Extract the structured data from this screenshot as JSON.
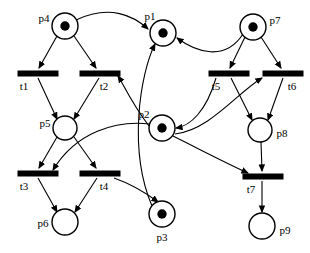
{
  "diagram": {
    "type": "petri-net",
    "width": 310,
    "height": 253,
    "background_color": "#ffffff",
    "stroke_color": "#000000"
  },
  "places": [
    {
      "id": "p4",
      "label": "p4",
      "cx": 65,
      "cy": 26,
      "r": 13,
      "tokens": 1,
      "label_x": 44,
      "label_y": 19,
      "label_anchor": "middle"
    },
    {
      "id": "p1",
      "label": "p1",
      "cx": 163,
      "cy": 33,
      "r": 13,
      "tokens": 1,
      "label_x": 150,
      "label_y": 17,
      "label_anchor": "middle"
    },
    {
      "id": "p7",
      "label": "p7",
      "cx": 253,
      "cy": 27,
      "r": 13,
      "tokens": 1,
      "label_x": 275,
      "label_y": 21,
      "label_anchor": "middle"
    },
    {
      "id": "p5",
      "label": "p5",
      "cx": 65,
      "cy": 128,
      "r": 12,
      "tokens": 0,
      "label_x": 45,
      "label_y": 124,
      "label_anchor": "middle"
    },
    {
      "id": "p2",
      "label": "p2",
      "cx": 162,
      "cy": 128,
      "r": 13,
      "tokens": 1,
      "label_x": 144,
      "label_y": 115,
      "label_anchor": "middle"
    },
    {
      "id": "p8",
      "label": "p8",
      "cx": 260,
      "cy": 130,
      "r": 12,
      "tokens": 0,
      "label_x": 282,
      "label_y": 134,
      "label_anchor": "middle"
    },
    {
      "id": "p6",
      "label": "p6",
      "cx": 65,
      "cy": 222,
      "r": 13,
      "tokens": 0,
      "label_x": 43,
      "label_y": 224,
      "label_anchor": "middle"
    },
    {
      "id": "p3",
      "label": "p3",
      "cx": 162,
      "cy": 214,
      "r": 13,
      "tokens": 1,
      "label_x": 162,
      "label_y": 238,
      "label_anchor": "middle"
    },
    {
      "id": "p9",
      "label": "p9",
      "cx": 262,
      "cy": 226,
      "r": 13,
      "tokens": 0,
      "label_x": 285,
      "label_y": 231,
      "label_anchor": "middle"
    }
  ],
  "transitions": [
    {
      "id": "t1",
      "label": "t1",
      "x": 18,
      "y": 71,
      "w": 40,
      "h": 5,
      "label_x": 24,
      "label_y": 87
    },
    {
      "id": "t2",
      "label": "t2",
      "x": 80,
      "y": 71,
      "w": 40,
      "h": 5,
      "label_x": 104,
      "label_y": 87
    },
    {
      "id": "t5",
      "label": "t5",
      "x": 209,
      "y": 71,
      "w": 40,
      "h": 5,
      "label_x": 216,
      "label_y": 87
    },
    {
      "id": "t6",
      "label": "t6",
      "x": 263,
      "y": 71,
      "w": 40,
      "h": 5,
      "label_x": 292,
      "label_y": 87
    },
    {
      "id": "t3",
      "label": "t3",
      "x": 18,
      "y": 171,
      "w": 40,
      "h": 5,
      "label_x": 24,
      "label_y": 187
    },
    {
      "id": "t4",
      "label": "t4",
      "x": 80,
      "y": 171,
      "w": 40,
      "h": 5,
      "label_x": 104,
      "label_y": 187
    },
    {
      "id": "t7",
      "label": "t7",
      "x": 243,
      "y": 174,
      "w": 40,
      "h": 5,
      "label_x": 251,
      "label_y": 190
    }
  ],
  "arcs": [
    {
      "from": "p4",
      "to": "t1",
      "d": "M 57 36 L 39 68"
    },
    {
      "from": "p4",
      "to": "t2",
      "d": "M 74 36 L 96 68"
    },
    {
      "from": "t1",
      "to": "p5",
      "d": "M 38 78 L 57 119"
    },
    {
      "from": "t2",
      "to": "p5",
      "d": "M 99 78 L 74 119"
    },
    {
      "from": "p4",
      "to": "p1",
      "d": "M 76 20 C 110 4 134 16 148 29"
    },
    {
      "from": "p5",
      "to": "t3",
      "d": "M 57 137 L 39 168"
    },
    {
      "from": "p5",
      "to": "t4",
      "d": "M 74 137 L 96 168"
    },
    {
      "from": "t3",
      "to": "p6",
      "d": "M 38 178 L 57 212"
    },
    {
      "from": "t4",
      "to": "p6",
      "d": "M 97 178 L 75 212"
    },
    {
      "from": "p2",
      "to": "t2",
      "d": "M 149 126 C 132 104 122 82 118 76"
    },
    {
      "from": "p2",
      "to": "t3",
      "d": "M 150 124 C 116 120 76 132 53 170"
    },
    {
      "from": "t4",
      "to": "p3",
      "d": "M 114 178 C 137 186 150 196 158 202"
    },
    {
      "from": "p3",
      "to": "p1",
      "d": "M 152 206 C 128 150 140 74 155 44"
    },
    {
      "from": "p7",
      "to": "t5",
      "d": "M 245 37 L 230 68"
    },
    {
      "from": "p7",
      "to": "t6",
      "d": "M 261 37 L 281 68"
    },
    {
      "from": "t5",
      "to": "p8",
      "d": "M 231 78 L 252 120"
    },
    {
      "from": "t6",
      "to": "p8",
      "d": "M 283 78 L 268 120"
    },
    {
      "from": "p7",
      "to": "p1",
      "d": "M 243 34 C 225 62 196 52 177 38"
    },
    {
      "from": "p2",
      "to": "t6",
      "d": "M 175 134 C 210 130 238 92 262 78"
    },
    {
      "from": "t5",
      "to": "p2",
      "d": "M 216 78 C 206 112 190 126 176 128"
    },
    {
      "from": "p8",
      "to": "t7",
      "d": "M 261 142 L 262 171"
    },
    {
      "from": "t7",
      "to": "p9",
      "d": "M 262 181 L 262 212"
    },
    {
      "from": "p2",
      "to": "t7",
      "d": "M 173 136 C 205 152 232 166 248 173"
    }
  ]
}
